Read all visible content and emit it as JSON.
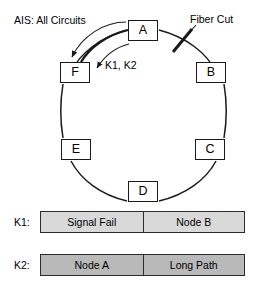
{
  "diagram": {
    "title_annotations": {
      "ais_label": "AIS: All Circuits",
      "fiber_cut_label": "Fiber Cut",
      "k_arc_label": "K1, K2"
    },
    "nodes": [
      {
        "id": "A",
        "label": "A",
        "x": 128,
        "y": 20,
        "w": 30,
        "h": 21
      },
      {
        "id": "B",
        "label": "B",
        "x": 196,
        "y": 62,
        "w": 30,
        "h": 21
      },
      {
        "id": "C",
        "label": "C",
        "x": 195,
        "y": 139,
        "w": 30,
        "h": 21
      },
      {
        "id": "D",
        "label": "D",
        "x": 128,
        "y": 181,
        "w": 30,
        "h": 21
      },
      {
        "id": "E",
        "label": "E",
        "x": 61,
        "y": 139,
        "w": 30,
        "h": 21
      },
      {
        "id": "F",
        "label": "F",
        "x": 60,
        "y": 62,
        "w": 30,
        "h": 21
      }
    ],
    "colors": {
      "stroke": "#1a1a1a",
      "k1_fill": "#d9d9d9",
      "k2_fill": "#b9b9b9",
      "background": "#ffffff"
    }
  },
  "kbytes": [
    {
      "name": "K1",
      "label": "K1:",
      "fill": "#d9d9d9",
      "cells": [
        {
          "text": "Signal Fail"
        },
        {
          "text": "Node B"
        }
      ]
    },
    {
      "name": "K2",
      "label": "K2:",
      "fill": "#b9b9b9",
      "cells": [
        {
          "text": "Node A"
        },
        {
          "text": "Long Path"
        }
      ]
    }
  ]
}
